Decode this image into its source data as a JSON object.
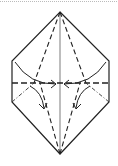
{
  "diagram": {
    "type": "origami-fold-instruction",
    "colors": {
      "stroke": "#222222",
      "background": "#ffffff",
      "border_dots": "#bbbbbb"
    },
    "elements": {
      "outline": "hexagon-outline",
      "center_crease": "vertical-center-crease",
      "valley_folds": [
        "upper-left-valley-fold",
        "upper-right-valley-fold",
        "lower-left-valley-fold",
        "lower-right-valley-fold"
      ],
      "horizontal_fold": "horizontal-dashed-fold",
      "arrows": [
        "left-curved-arrow-right",
        "right-curved-arrow-left",
        "left-curved-arrow-down",
        "right-curved-arrow-down"
      ]
    }
  }
}
